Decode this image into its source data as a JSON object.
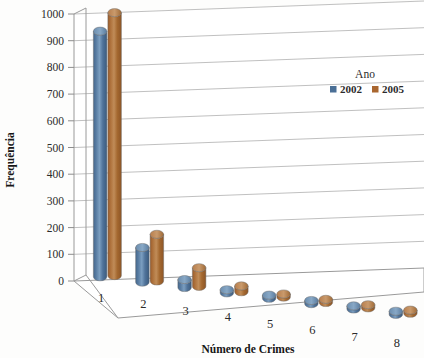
{
  "chart_data": {
    "type": "bar",
    "title": "",
    "xlabel": "Número de Crimes",
    "ylabel": "Frequência",
    "categories": [
      "1",
      "2",
      "3",
      "4",
      "5",
      "6",
      "7",
      "8"
    ],
    "series": [
      {
        "name": "2002",
        "color": "#4a6f96",
        "values": [
          920,
          130,
          30,
          8,
          6,
          5,
          4,
          4
        ]
      },
      {
        "name": "2005",
        "color": "#a9662f",
        "values": [
          985,
          175,
          70,
          22,
          12,
          8,
          6,
          5
        ]
      }
    ],
    "legend_title": "Ano",
    "legend_position": "top-right",
    "ylim": [
      0,
      1000
    ],
    "yticks": [
      0,
      100,
      200,
      300,
      400,
      500,
      600,
      700,
      800,
      900,
      1000
    ],
    "ytick_labels": [
      "0",
      "100",
      "200",
      "300",
      "400",
      "500",
      "600",
      "700",
      "800",
      "900",
      "1000"
    ],
    "grid": true,
    "three_d": true
  },
  "axes": {
    "y_title": "Frequência",
    "x_title": "Número de Crimes",
    "y_ticks": [
      "1000",
      "900",
      "800",
      "700",
      "600",
      "500",
      "400",
      "300",
      "200",
      "100",
      "0"
    ],
    "x_ticks": [
      "1",
      "2",
      "3",
      "4",
      "5",
      "6",
      "7",
      "8"
    ]
  },
  "legend": {
    "title": "Ano",
    "entries": [
      {
        "label": "2002",
        "color": "#4a6f96"
      },
      {
        "label": "2005",
        "color": "#a9662f"
      }
    ]
  },
  "colors": {
    "series_2002": "#4a6f96",
    "series_2005": "#a9662f",
    "gridline": "#b9b9b9",
    "background": "#fdfdfc",
    "text": "#2b2b2b"
  }
}
